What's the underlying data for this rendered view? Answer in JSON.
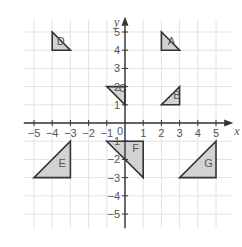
{
  "diagram": {
    "type": "coordinate-grid",
    "origin_px": [
      125,
      123
    ],
    "unit_px": 18.2,
    "grid_range": {
      "x": [
        -6,
        6
      ],
      "y": [
        -6,
        6
      ]
    },
    "axes": {
      "x_label": "x",
      "y_label": "y",
      "origin_label": "0",
      "x_ticks": [
        -5,
        -4,
        -3,
        -2,
        -1,
        1,
        2,
        3,
        4,
        5
      ],
      "y_ticks": [
        5,
        4,
        3,
        2,
        1,
        -1,
        -2,
        -3,
        -4,
        -5
      ],
      "x_tick_labels": [
        "−5",
        "−4",
        "−3",
        "−2",
        "−1",
        "1",
        "2",
        "3",
        "4",
        "5"
      ],
      "y_tick_labels": [
        "5",
        "4",
        "3",
        "2",
        "1",
        "−1",
        "−2",
        "−3",
        "−4",
        "−5"
      ]
    },
    "colors": {
      "fill": "#d2d2d2",
      "stroke": "#333333",
      "grid": "#e2e2e2",
      "text": "#555555"
    },
    "shapes": [
      {
        "label": "A",
        "vertices": [
          [
            2,
            5
          ],
          [
            2,
            4
          ],
          [
            3,
            4
          ]
        ],
        "label_at": [
          2.35,
          4.3
        ]
      },
      {
        "label": "B",
        "vertices": [
          [
            2,
            1
          ],
          [
            3,
            1
          ],
          [
            3,
            2
          ]
        ],
        "label_at": [
          2.65,
          1.3
        ]
      },
      {
        "label": "C",
        "vertices": [
          [
            -1,
            2
          ],
          [
            0,
            2
          ],
          [
            0,
            1
          ]
        ],
        "label_at": [
          -0.35,
          1.7
        ]
      },
      {
        "label": "D",
        "vertices": [
          [
            -4,
            5
          ],
          [
            -4,
            4
          ],
          [
            -3,
            4
          ]
        ],
        "label_at": [
          -3.75,
          4.3
        ]
      },
      {
        "label": "E",
        "vertices": [
          [
            -5,
            -3
          ],
          [
            -3,
            -3
          ],
          [
            -3,
            -1
          ]
        ],
        "label_at": [
          -3.65,
          -2.4
        ]
      },
      {
        "label": "F",
        "vertices": [
          [
            -1,
            -1
          ],
          [
            1,
            -1
          ],
          [
            1,
            -3
          ]
        ],
        "label_at": [
          0.4,
          -1.6
        ]
      },
      {
        "label": "G",
        "vertices": [
          [
            3,
            -3
          ],
          [
            5,
            -3
          ],
          [
            5,
            -1
          ]
        ],
        "label_at": [
          4.35,
          -2.4
        ]
      }
    ]
  }
}
